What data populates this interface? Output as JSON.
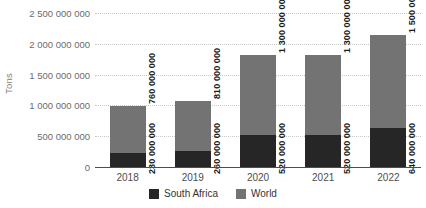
{
  "chart_data": {
    "type": "bar",
    "subtype": "stacked-bar",
    "title": "",
    "xlabel": "",
    "ylabel": "Tons",
    "categories": [
      "2018",
      "2019",
      "2020",
      "2021",
      "2022"
    ],
    "series": [
      {
        "name": "South Africa",
        "color": "#262626",
        "values": [
          230000000,
          260000000,
          520000000,
          520000000,
          640000000
        ],
        "value_labels": [
          "230 000 000",
          "260 000 000",
          "520 000 000",
          "520 000 000",
          "640 000 000"
        ]
      },
      {
        "name": "World",
        "color": "#737373",
        "values": [
          760000000,
          810000000,
          1300000000,
          1300000000,
          1500000000
        ],
        "value_labels": [
          "760 000 000",
          "810 000 000",
          "1 300 000 000",
          "1 300 000 000",
          "1 500 000 000"
        ]
      }
    ],
    "totals": [
      990000000,
      1070000000,
      1820000000,
      1820000000,
      2140000000
    ],
    "ylim": [
      0,
      2500000000
    ],
    "ytick_values": [
      0,
      500000000,
      1000000000,
      1500000000,
      2000000000,
      2500000000
    ],
    "ytick_labels": [
      "0",
      "500 000 000",
      "1 000 000 000",
      "1 500 000 000",
      "2 000 000 000",
      "2 500 000 000"
    ],
    "grid": true,
    "grid_style": "dotted",
    "grid_color": "#c8c8c8",
    "legend_position": "bottom-center",
    "background_color": "#ffffff",
    "axis_color": "#4d4d4d"
  },
  "legend": {
    "items": [
      {
        "label": "South Africa",
        "color": "#262626"
      },
      {
        "label": "World",
        "color": "#737373"
      }
    ]
  }
}
